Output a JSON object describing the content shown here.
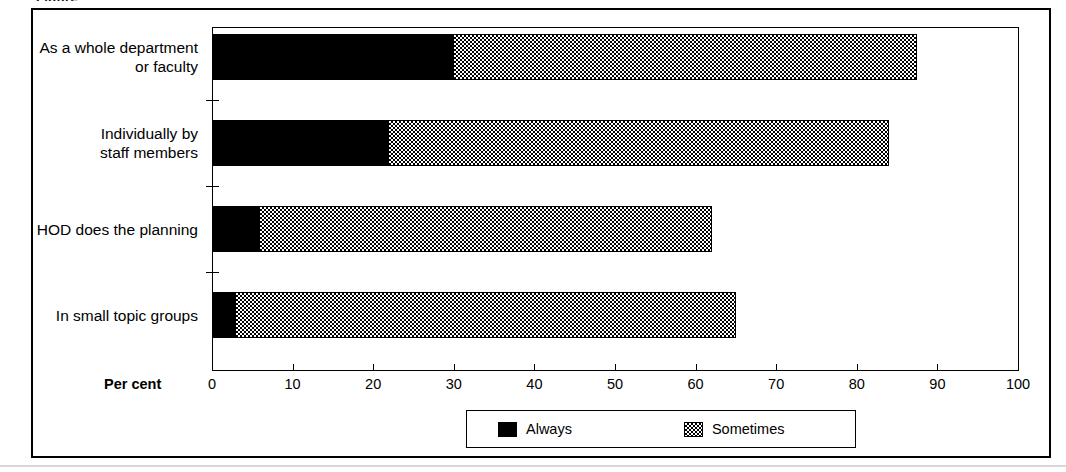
{
  "figure": {
    "caption_stub": "Figure"
  },
  "chart_data": {
    "type": "bar",
    "orientation": "horizontal",
    "stacked": true,
    "title": "",
    "xlabel": "Per cent",
    "ylabel": "",
    "xlim": [
      0,
      100
    ],
    "xticks": [
      0,
      10,
      20,
      30,
      40,
      50,
      60,
      70,
      80,
      90,
      100
    ],
    "xtick_labels": [
      "0",
      "10",
      "20",
      "30",
      "40",
      "50",
      "60",
      "70",
      "80",
      "90",
      "100"
    ],
    "grid": false,
    "legend_position": "bottom",
    "categories": [
      "As a whole department or faculty",
      "Individually by staff members",
      "HOD does the planning",
      "In small topic groups"
    ],
    "category_label_lines": [
      [
        "As a whole department",
        "or faculty"
      ],
      [
        "Individually by",
        "staff members"
      ],
      [
        "HOD does the planning"
      ],
      [
        "In small topic groups"
      ]
    ],
    "series": [
      {
        "name": "Always",
        "color": "#000000",
        "pattern": "solid",
        "values": [
          30,
          22,
          6,
          3
        ]
      },
      {
        "name": "Sometimes",
        "color": "#000000",
        "pattern": "checkerboard",
        "values": [
          57.5,
          62,
          56,
          62
        ]
      }
    ],
    "totals": [
      87.5,
      84,
      62,
      65
    ]
  },
  "legend": {
    "items": [
      {
        "label": "Always"
      },
      {
        "label": "Sometimes"
      }
    ]
  }
}
